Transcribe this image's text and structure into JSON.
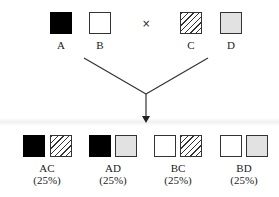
{
  "parents": [
    {
      "label": "A",
      "fill": "black"
    },
    {
      "label": "B",
      "fill": "white"
    },
    {
      "label": "C",
      "fill": "hatched"
    },
    {
      "label": "D",
      "fill": "gray"
    }
  ],
  "cross_symbol": "×",
  "offspring": [
    {
      "genotype": "AC",
      "percent": "(25%)"
    },
    {
      "genotype": "AD",
      "percent": "(25%)"
    },
    {
      "genotype": "BC",
      "percent": "(25%)"
    },
    {
      "genotype": "BD",
      "percent": "(25%)"
    }
  ],
  "colors": {
    "black": "#000000",
    "gray": "#e2e2e2",
    "line": "#333333"
  }
}
